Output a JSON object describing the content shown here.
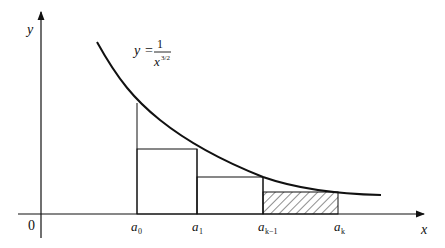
{
  "figure": {
    "type": "integral-test-diagram",
    "function_label": {
      "lhs": "y",
      "equals": "=",
      "numerator": "1",
      "denominator_base": "x",
      "denominator_exponent": "3/2"
    },
    "axes": {
      "x_label": "x",
      "y_label": "y",
      "origin_label": "0"
    },
    "tick_labels": [
      {
        "base": "a",
        "sub": "0"
      },
      {
        "base": "a",
        "sub": "1"
      },
      {
        "base": "a",
        "sub": "k−1"
      },
      {
        "base": "a",
        "sub": "k"
      }
    ],
    "colors": {
      "stroke": "#111111",
      "background": "#ffffff"
    }
  }
}
